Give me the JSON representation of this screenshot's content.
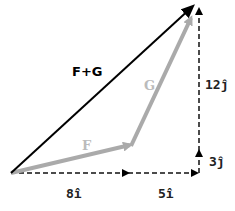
{
  "diagram": {
    "colors": {
      "resultant": "#000000",
      "components": "#aaaaaa",
      "dashed": "#111111",
      "background": "#ffffff"
    },
    "vectors": [
      {
        "name": "F",
        "label": "F",
        "color": "#aaaaaa"
      },
      {
        "name": "G",
        "label": "G",
        "color": "#aaaaaa"
      },
      {
        "name": "F+G",
        "label": "F+G",
        "color": "#000000"
      }
    ],
    "components": {
      "f_x": "8î",
      "g_x": "5î",
      "f_y": "3ĵ",
      "g_y": "12ĵ"
    }
  }
}
